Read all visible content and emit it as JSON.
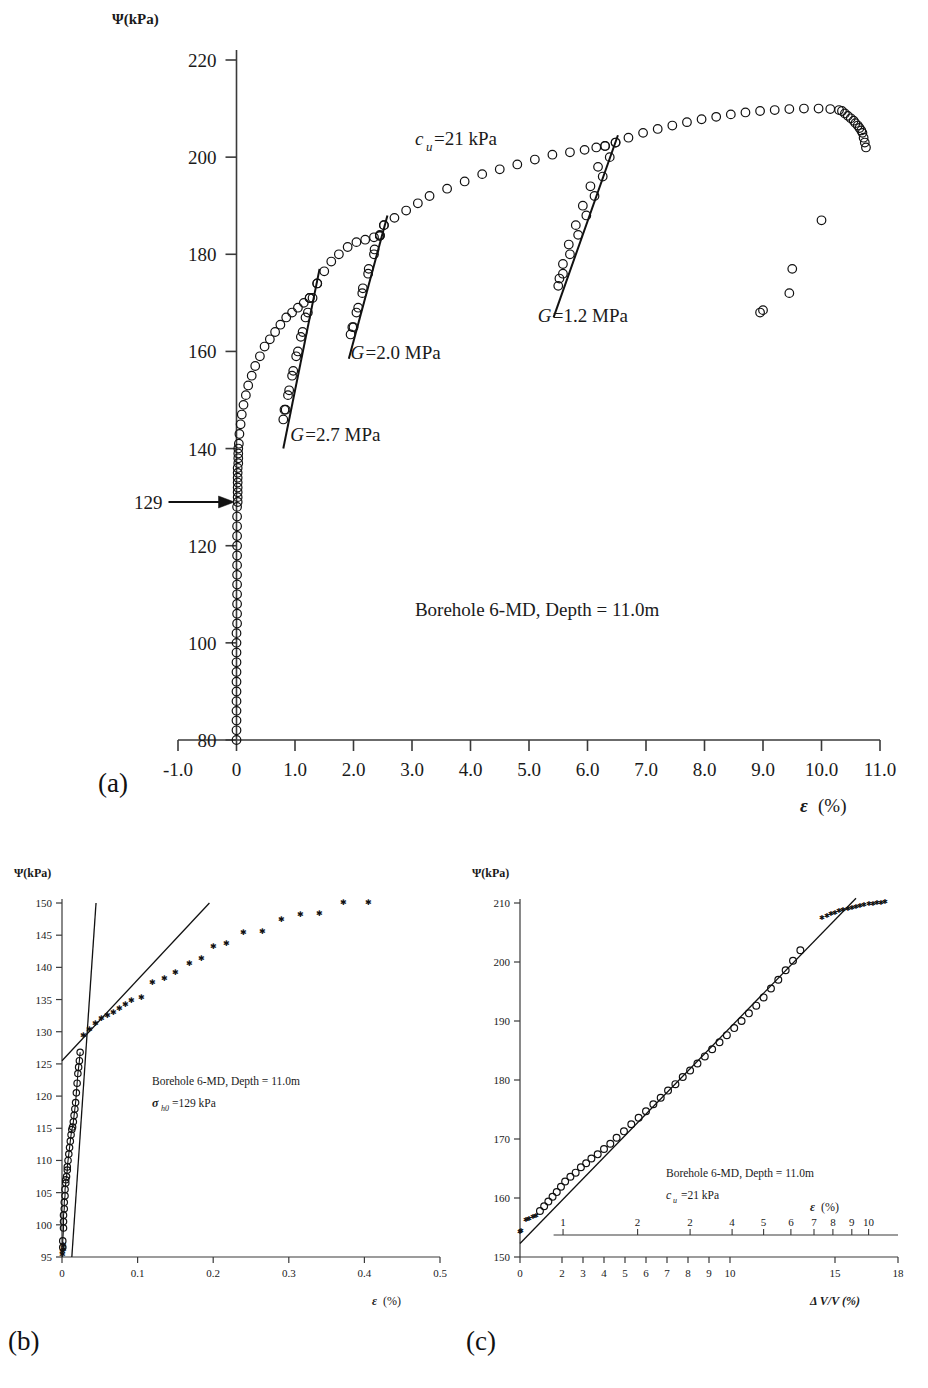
{
  "figure": {
    "panels": [
      {
        "id": "a",
        "label": "(a)"
      },
      {
        "id": "b",
        "label": "(b)"
      },
      {
        "id": "c",
        "label": "(c)"
      }
    ]
  },
  "panel_a": {
    "ylabel": "Ψ(kPa)",
    "xlabel_symbol": "ε",
    "xlabel_unit": "(%)",
    "yticks": [
      "80",
      "100",
      "120",
      "140",
      "160",
      "180",
      "200",
      "220"
    ],
    "ytick_values": [
      80,
      100,
      120,
      140,
      160,
      180,
      200,
      220
    ],
    "xticks": [
      "-1.0",
      "0",
      "1.0",
      "2.0",
      "3.0",
      "4.0",
      "5.0",
      "6.0",
      "7.0",
      "8.0",
      "9.0",
      "10.0",
      "11.0"
    ],
    "xtick_values": [
      -1,
      0,
      1,
      2,
      3,
      4,
      5,
      6,
      7,
      8,
      9,
      10,
      11
    ],
    "highlight_tick": "129",
    "highlight_value": 129,
    "annotations": [
      {
        "name": "cu-label",
        "text": "c_u =21 kPa",
        "sub": "u",
        "pre": "c",
        "post": " =21 kPa",
        "x": 3.05,
        "y": 202.5
      },
      {
        "name": "g1-label",
        "text": "G =2.7 MPa",
        "pre": "G",
        "post": " =2.7 MPa",
        "x": 0.92,
        "y": 141.5
      },
      {
        "name": "g2-label",
        "text": "G =2.0 MPa",
        "pre": "G",
        "post": " =2.0 MPa",
        "x": 1.95,
        "y": 158.5
      },
      {
        "name": "g3-label",
        "text": "G =1.2 MPa",
        "pre": "G",
        "post": " =1.2 MPa",
        "x": 5.15,
        "y": 166.0
      },
      {
        "name": "test-caption",
        "text": "Borehole 6-MD, Depth = 11.0m",
        "x": 3.05,
        "y": 105.5
      }
    ]
  },
  "panel_b": {
    "ylabel": "Ψ(kPa)",
    "xlabel_symbol": "ε",
    "xlabel_unit": "(%)",
    "yticks": [
      "95",
      "100",
      "105",
      "110",
      "115",
      "120",
      "125",
      "130",
      "135",
      "140",
      "145",
      "150"
    ],
    "ytick_values": [
      95,
      100,
      105,
      110,
      115,
      120,
      125,
      130,
      135,
      140,
      145,
      150
    ],
    "xticks": [
      "0",
      "0.1",
      "0.2",
      "0.3",
      "0.4",
      "0.5"
    ],
    "xtick_values": [
      0,
      0.1,
      0.2,
      0.3,
      0.4,
      0.5
    ],
    "annotations": [
      {
        "name": "test-caption",
        "text": "Borehole 6-MD, Depth = 11.0m"
      },
      {
        "name": "sigma-h0-label",
        "pre": "σ",
        "sub": "h0",
        "post": " =129 kPa"
      }
    ]
  },
  "panel_c": {
    "ylabel": "Ψ(kPa)",
    "xlabel_top_symbol": "ε",
    "xlabel_top_unit": "(%)",
    "xlabel_bottom": "Δ V/V (%)",
    "yticks": [
      "150",
      "160",
      "170",
      "180",
      "190",
      "200",
      "210"
    ],
    "ytick_values": [
      150,
      160,
      170,
      180,
      190,
      200,
      210
    ],
    "xticks_bottom": [
      "0",
      "2",
      "3",
      "4",
      "5",
      "6",
      "7",
      "8",
      "9",
      "10",
      "15",
      "18"
    ],
    "xtick_bottom_values": [
      0,
      2,
      3,
      4,
      5,
      6,
      7,
      8,
      9,
      10,
      15,
      18
    ],
    "xticks_top": [
      "1",
      "2",
      "2",
      "4",
      "5",
      "6",
      "7",
      "8",
      "9",
      "10"
    ],
    "xtick_top_values": [
      1,
      2,
      3,
      4,
      5,
      6,
      7,
      8,
      9,
      10
    ],
    "annotations": [
      {
        "name": "test-caption",
        "text": "Borehole 6-MD, Depth = 11.0m"
      },
      {
        "name": "cu-label",
        "pre": "c",
        "sub": "u",
        "post": " =21 kPa"
      }
    ]
  },
  "chart_data": [
    {
      "panel": "a",
      "type": "scatter",
      "title": "",
      "xlabel": "ε (%)",
      "ylabel": "Ψ (kPa)",
      "xlim": [
        -1.0,
        11.0
      ],
      "ylim": [
        80,
        220
      ],
      "grid": false,
      "legend": false,
      "marker": "open-circle",
      "annotations_values": {
        "cu_kPa": 21,
        "sigma_h0_kPa": 129,
        "G_unload_reload_MPa": [
          2.7,
          2.0,
          1.2
        ],
        "borehole": "6-MD",
        "depth_m": 11.0
      },
      "series": [
        {
          "name": "pressuremeter expansion curve",
          "points_x": [
            0.0,
            0.0,
            0.0,
            0.0,
            0.0,
            0.0,
            0.0,
            0.0,
            0.0,
            0.0,
            0.0,
            0.0,
            0.01,
            0.01,
            0.01,
            0.01,
            0.01,
            0.01,
            0.01,
            0.01,
            0.01,
            0.01,
            0.01,
            0.01,
            0.01,
            0.02,
            0.02,
            0.02,
            0.02,
            0.02,
            0.02,
            0.02,
            0.02,
            0.03,
            0.03,
            0.03,
            0.03,
            0.04,
            0.05,
            0.07,
            0.09,
            0.12,
            0.16,
            0.2,
            0.26,
            0.32,
            0.4,
            0.48,
            0.57,
            0.66,
            0.75,
            0.85,
            0.95,
            1.05,
            1.15,
            1.25
          ],
          "points_y": [
            80,
            82,
            84,
            86,
            88,
            90,
            92,
            94,
            96,
            98,
            100,
            102,
            104,
            106,
            108,
            110,
            112,
            114,
            116,
            118,
            120,
            122,
            124,
            126,
            128,
            129,
            130,
            131,
            132,
            133,
            134,
            135,
            136,
            137,
            138,
            139,
            140,
            141,
            143,
            145,
            147,
            149,
            151,
            153,
            155,
            157,
            159,
            161,
            162.5,
            164,
            165.5,
            167,
            168,
            169,
            170,
            171
          ],
          "note": "initial near-vertical segment then curved loading branch"
        },
        {
          "name": "unload-reload loop 1 (G=2.7 MPa)",
          "points_x": [
            1.25,
            1.18,
            1.1,
            1.02,
            0.95,
            0.88,
            0.82,
            0.8,
            0.84,
            0.9,
            0.97,
            1.05,
            1.13,
            1.22,
            1.3,
            1.38
          ],
          "points_y": [
            171,
            167,
            163,
            159,
            155,
            151,
            148,
            146,
            148,
            152,
            156,
            160,
            164,
            168,
            171,
            174
          ]
        },
        {
          "name": "loading branch 2",
          "points_x": [
            1.38,
            1.5,
            1.62,
            1.75,
            1.9,
            2.05,
            2.2,
            2.35,
            2.45
          ],
          "points_y": [
            174,
            176.5,
            178.5,
            180,
            181.5,
            182.5,
            183,
            183.5,
            183.8
          ]
        },
        {
          "name": "unload-reload loop 2 (G=2.0 MPa)",
          "points_x": [
            2.45,
            2.35,
            2.25,
            2.15,
            2.05,
            1.98,
            1.95,
            2.0,
            2.08,
            2.16,
            2.26,
            2.36,
            2.45,
            2.52
          ],
          "points_y": [
            183.8,
            180,
            176,
            172,
            168,
            165,
            163.5,
            165,
            169,
            173,
            177,
            181,
            184,
            186
          ]
        },
        {
          "name": "loading branch 3",
          "points_x": [
            2.52,
            2.7,
            2.9,
            3.1,
            3.3,
            3.6,
            3.9,
            4.2,
            4.5,
            4.8,
            5.1,
            5.4,
            5.7,
            5.95,
            6.15,
            6.3
          ],
          "points_y": [
            186,
            187.5,
            189,
            190.5,
            192,
            193.5,
            195,
            196.5,
            197.5,
            198.5,
            199.5,
            200.5,
            201,
            201.5,
            202,
            202.3
          ]
        },
        {
          "name": "unload-reload loop 3 (G=1.2 MPa)",
          "points_x": [
            6.3,
            6.18,
            6.05,
            5.92,
            5.8,
            5.68,
            5.58,
            5.52,
            5.5,
            5.58,
            5.7,
            5.84,
            5.98,
            6.12,
            6.26,
            6.38,
            6.48
          ],
          "points_y": [
            202.3,
            198,
            194,
            190,
            186,
            182,
            178,
            175,
            173.5,
            176,
            180,
            184,
            188,
            192,
            196,
            200,
            203
          ]
        },
        {
          "name": "loading branch 4 to peak",
          "points_x": [
            6.48,
            6.7,
            6.95,
            7.2,
            7.45,
            7.7,
            7.95,
            8.2,
            8.45,
            8.7,
            8.95,
            9.2,
            9.45,
            9.7,
            9.95,
            10.15,
            10.3
          ],
          "points_y": [
            203,
            204,
            205,
            205.8,
            206.5,
            207.2,
            207.8,
            208.3,
            208.8,
            209.2,
            209.5,
            209.7,
            209.9,
            210,
            210,
            209.9,
            209.7
          ]
        },
        {
          "name": "final unloading",
          "points_x": [
            10.35,
            10.4,
            10.45,
            10.5,
            10.55,
            10.58,
            10.62,
            10.65,
            10.68,
            10.7,
            10.72,
            10.74,
            10.76
          ],
          "points_y": [
            209.5,
            209,
            208.5,
            208,
            207.5,
            207,
            206.5,
            206,
            205.5,
            205,
            204,
            203,
            202
          ]
        },
        {
          "name": "post-test scattered points",
          "points_x": [
            8.95,
            9.0,
            9.45,
            9.5,
            10.0
          ],
          "points_y": [
            168,
            168.5,
            172,
            177,
            187
          ]
        }
      ],
      "unload_reload_fit_lines": [
        {
          "name": "G=2.7 MPa",
          "x1": 0.8,
          "y1": 140.0,
          "x2": 1.42,
          "y2": 177.0
        },
        {
          "name": "G=2.0 MPa",
          "x1": 1.92,
          "y1": 158.5,
          "x2": 2.58,
          "y2": 188.0
        },
        {
          "name": "G=1.2 MPa",
          "x1": 5.42,
          "y1": 167.0,
          "x2": 6.52,
          "y2": 204.5
        }
      ]
    },
    {
      "panel": "b",
      "type": "scatter",
      "title": "",
      "xlabel": "ε (%)",
      "ylabel": "Ψ (kPa)",
      "xlim": [
        0,
        0.5
      ],
      "ylim": [
        95,
        150
      ],
      "grid": false,
      "legend": false,
      "annotations_values": {
        "sigma_h0_kPa": 129,
        "borehole": "6-MD",
        "depth_m": 11.0
      },
      "series": [
        {
          "name": "early expansion (open circles)",
          "marker": "open-circle",
          "points_x": [
            0.001,
            0.001,
            0.002,
            0.002,
            0.002,
            0.003,
            0.003,
            0.004,
            0.004,
            0.005,
            0.005,
            0.006,
            0.007,
            0.007,
            0.008,
            0.009,
            0.01,
            0.011,
            0.012,
            0.013,
            0.014,
            0.015,
            0.016,
            0.017,
            0.018,
            0.019,
            0.02,
            0.021,
            0.022,
            0.023,
            0.024
          ],
          "points_y": [
            96.5,
            97.5,
            99.5,
            100.5,
            101.5,
            102.5,
            103.5,
            104.5,
            105.5,
            106.5,
            107.0,
            107.5,
            108.5,
            109.0,
            110.0,
            111.0,
            112.0,
            113.0,
            114.0,
            114.8,
            115.2,
            116.0,
            117.0,
            118.0,
            119.0,
            120.5,
            122.0,
            123.5,
            124.5,
            125.5,
            126.8
          ]
        },
        {
          "name": "expansion beyond sigma_h0 (stars)",
          "marker": "star",
          "points_x": [
            0.0005,
            0.001,
            0.0015,
            0.002,
            0.028,
            0.036,
            0.044,
            0.052,
            0.06,
            0.068,
            0.076,
            0.084,
            0.092,
            0.105,
            0.12,
            0.135,
            0.15,
            0.168,
            0.185,
            0.2,
            0.218,
            0.24,
            0.265,
            0.29,
            0.315,
            0.34,
            0.372,
            0.405
          ],
          "points_y": [
            95.3,
            95.8,
            96.2,
            96.8,
            129.3,
            130.3,
            131.2,
            132.0,
            132.5,
            133.0,
            133.6,
            134.2,
            134.8,
            135.2,
            137.6,
            138.3,
            139.1,
            140.6,
            141.3,
            143.2,
            143.6,
            145.4,
            145.6,
            147.4,
            148.1,
            148.4,
            150.0,
            150.0
          ]
        }
      ],
      "fit_lines": [
        {
          "name": "initial steep modulus line",
          "x1": 0.013,
          "y1": 95.0,
          "x2": 0.045,
          "y2": 150.0
        },
        {
          "name": "reload / sigma_h0 intersection line",
          "x1": 0.0,
          "y1": 125.5,
          "x2": 0.195,
          "y2": 150.0
        }
      ],
      "intersection": {
        "x": 0.028,
        "y": 129.0,
        "label": "σ_h0 = 129 kPa"
      }
    },
    {
      "panel": "c",
      "type": "scatter",
      "title": "",
      "xlabel": "Δ V/V (%)",
      "xlabel_secondary": "ε (%)",
      "ylabel": "Ψ (kPa)",
      "xlim": [
        0,
        18
      ],
      "ylim": [
        150,
        210
      ],
      "grid": false,
      "legend": false,
      "annotations_values": {
        "cu_kPa": 21,
        "borehole": "6-MD",
        "depth_m": 11.0
      },
      "series": [
        {
          "name": "log-volume expansion (stars, early)",
          "marker": "star",
          "points_x": [
            0.02,
            0.05,
            0.3,
            0.45,
            0.6,
            0.75
          ],
          "points_y": [
            154.3,
            154.5,
            156.3,
            156.5,
            156.8,
            157.0
          ]
        },
        {
          "name": "log-volume expansion (open circles)",
          "marker": "open-circle",
          "points_x": [
            0.95,
            1.15,
            1.35,
            1.55,
            1.75,
            1.95,
            2.15,
            2.4,
            2.65,
            2.9,
            3.15,
            3.4,
            3.7,
            4.0,
            4.3,
            4.6,
            4.95,
            5.3,
            5.65,
            6.0,
            6.35,
            6.7,
            7.05,
            7.4,
            7.75,
            8.1,
            8.45,
            8.8,
            9.15,
            9.5,
            9.85,
            10.2,
            10.55,
            10.9,
            11.25,
            11.6,
            11.95,
            12.3,
            12.65,
            13.0,
            13.35
          ],
          "points_y": [
            157.8,
            158.6,
            159.4,
            160.2,
            161.0,
            161.9,
            162.8,
            163.6,
            164.3,
            165.2,
            165.9,
            166.7,
            167.4,
            168.3,
            169.2,
            170.2,
            171.3,
            172.5,
            173.6,
            174.7,
            175.9,
            177.0,
            178.2,
            179.3,
            180.5,
            181.6,
            182.8,
            184.0,
            185.2,
            186.4,
            187.6,
            188.8,
            190.0,
            191.3,
            192.6,
            194.0,
            195.5,
            197.0,
            198.6,
            200.2,
            202.0
          ]
        },
        {
          "name": "peak plateau (stars)",
          "marker": "star",
          "points_x": [
            14.4,
            14.6,
            14.8,
            15.0,
            15.2,
            15.4,
            15.6,
            15.8,
            16.0,
            16.2,
            16.4,
            16.6,
            16.8,
            17.0,
            17.2,
            17.4
          ],
          "points_y": [
            207.5,
            207.8,
            208.1,
            208.3,
            208.6,
            208.8,
            209.0,
            209.2,
            209.3,
            209.5,
            209.6,
            209.8,
            209.9,
            210.0,
            210.1,
            210.2
          ]
        }
      ],
      "fit_lines": [
        {
          "name": "cu slope line",
          "x1": 0.0,
          "y1": 152.3,
          "x2": 16.0,
          "y2": 210.8,
          "slope_note": "slope gives c_u = 21 kPa"
        }
      ]
    }
  ]
}
